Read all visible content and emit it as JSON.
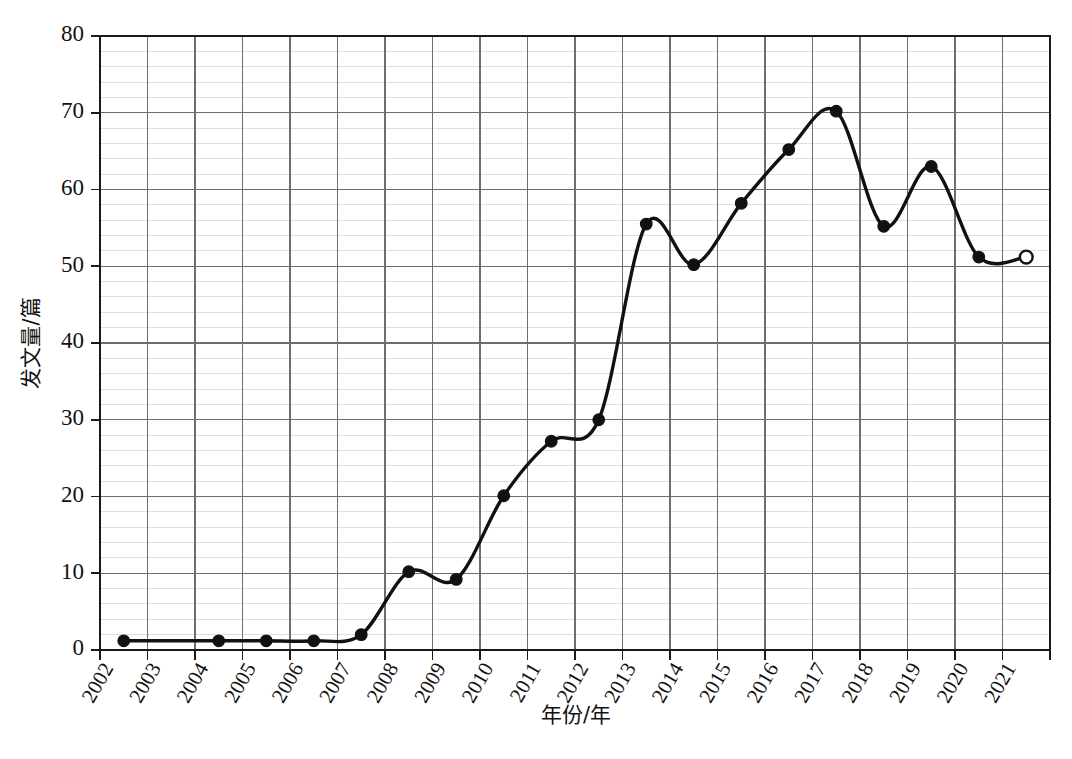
{
  "chart_data": {
    "type": "line",
    "title": "",
    "xlabel": "年份/年",
    "ylabel": "发文量/篇",
    "xlim": [
      2001.5,
      2021.5
    ],
    "ylim": [
      0,
      80
    ],
    "ytick_values": [
      0,
      10,
      20,
      30,
      40,
      50,
      60,
      70,
      80
    ],
    "ytick_labels": [
      "0",
      "10",
      "20",
      "30",
      "40",
      "50",
      "60",
      "70",
      "80"
    ],
    "y_major_step": 10,
    "y_minor_step": 2,
    "grid": "major and minor horizontal, major vertical",
    "legend": "none",
    "categories": [
      "2002",
      "2003",
      "2004",
      "2005",
      "2006",
      "2007",
      "2008",
      "2009",
      "2010",
      "2011",
      "2012",
      "2013",
      "2014",
      "2015",
      "2016",
      "2017",
      "2018",
      "2019",
      "2020",
      "2021"
    ],
    "series": [
      {
        "name": "发文量",
        "values": [
          1.2,
          1.2,
          1.2,
          1.2,
          1.2,
          2.0,
          10.2,
          9.2,
          20.1,
          27.2,
          30.0,
          55.5,
          50.2,
          58.2,
          65.2,
          70.2,
          55.2,
          63.0,
          51.2,
          51.2
        ],
        "marker_style": [
          "filled",
          "none",
          "filled",
          "filled",
          "filled",
          "filled",
          "filled",
          "filled",
          "filled",
          "filled",
          "filled",
          "filled",
          "filled",
          "filled",
          "filled",
          "filled",
          "filled",
          "filled",
          "filled",
          "open"
        ]
      }
    ]
  }
}
